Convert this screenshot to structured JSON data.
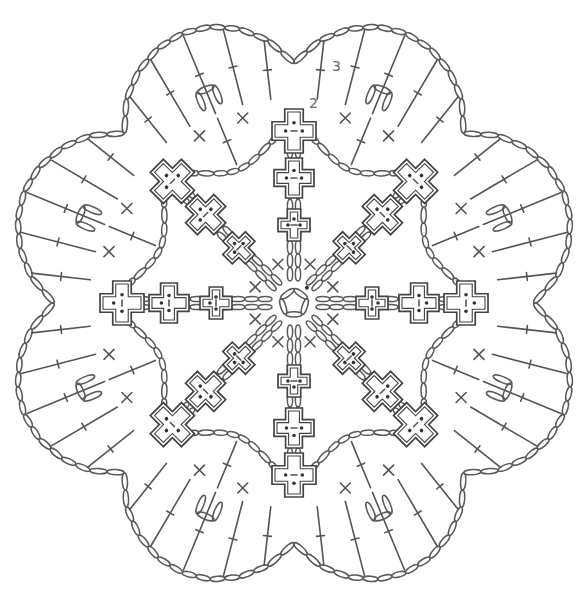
{
  "diagram": {
    "type": "crochet-chart",
    "center": [
      294,
      303
    ],
    "symmetry": 8,
    "stroke_color": "#555555",
    "background": "#ffffff",
    "arms": {
      "count": 8,
      "angles_deg": [
        -90,
        -45,
        0,
        45,
        90,
        135,
        180,
        225
      ],
      "cross_positions_r": [
        78,
        125,
        172
      ],
      "cross_sizes": [
        16,
        20,
        22
      ]
    },
    "center_ring": {
      "radius": 14,
      "stitches": 5
    },
    "middle_ring": {
      "radius": 200,
      "arc_count": 8
    },
    "outer_edge": {
      "lobe_tip_r": 292,
      "valley_r": 240,
      "lobe_count": 8
    },
    "round_labels": [
      {
        "text": "3",
        "x": 336,
        "y": 68
      },
      {
        "text": "2",
        "x": 314,
        "y": 105
      }
    ]
  }
}
